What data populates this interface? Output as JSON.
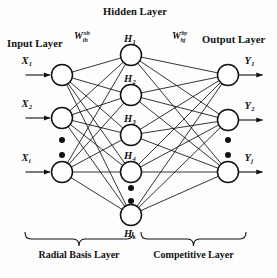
{
  "figure": {
    "type": "neural-network-architecture-diagram",
    "background_color": "#fdfdfd",
    "stroke_color": "#111111"
  },
  "titles": {
    "input_layer": "Input Layer",
    "hidden_layer": "Hidden Layer",
    "output_layer": "Output Layer"
  },
  "weights": {
    "input_to_hidden": {
      "base": "W",
      "subscript": "ih",
      "superscript": "xh"
    },
    "hidden_to_output": {
      "base": "W",
      "subscript": "hj",
      "superscript": "hy"
    }
  },
  "layers": {
    "input": {
      "name": "input-layer",
      "nodes": [
        {
          "id": "x1",
          "base": "X",
          "sub": "1",
          "cx": 62,
          "cy": 75
        },
        {
          "id": "x2",
          "base": "X",
          "sub": "2",
          "cx": 62,
          "cy": 118
        },
        {
          "id": "xi",
          "base": "X",
          "sub": "i",
          "cx": 62,
          "cy": 172
        }
      ],
      "ellipsis_dots": [
        {
          "cx": 62,
          "cy": 140
        },
        {
          "cx": 62,
          "cy": 155
        }
      ]
    },
    "hidden": {
      "name": "hidden-layer",
      "nodes": [
        {
          "id": "h1",
          "base": "H",
          "sub": "1",
          "cx": 131,
          "cy": 55
        },
        {
          "id": "h2",
          "base": "H",
          "sub": "2",
          "cx": 131,
          "cy": 95
        },
        {
          "id": "h3",
          "base": "H",
          "sub": "3",
          "cx": 131,
          "cy": 135
        },
        {
          "id": "h4",
          "base": "H",
          "sub": "4",
          "cx": 131,
          "cy": 172
        },
        {
          "id": "hk",
          "base": "H",
          "sub": "k",
          "cx": 131,
          "cy": 215
        }
      ],
      "ellipsis_dots": [
        {
          "cx": 131,
          "cy": 188
        },
        {
          "cx": 131,
          "cy": 201
        }
      ]
    },
    "output": {
      "name": "output-layer",
      "nodes": [
        {
          "id": "y1",
          "base": "Y",
          "sub": "1",
          "cx": 228,
          "cy": 75
        },
        {
          "id": "y2",
          "base": "Y",
          "sub": "2",
          "cx": 228,
          "cy": 120
        },
        {
          "id": "yj",
          "base": "Y",
          "sub": "j",
          "cx": 228,
          "cy": 172
        }
      ],
      "ellipsis_dots": [
        {
          "cx": 228,
          "cy": 140
        },
        {
          "cx": 228,
          "cy": 155
        }
      ]
    }
  },
  "brackets": [
    {
      "id": "radial-basis",
      "label": "Radial Basis Layer",
      "x_start": 25,
      "x_end": 133,
      "y": 232
    },
    {
      "id": "competitive",
      "label": "Competitive Layer",
      "x_start": 141,
      "x_end": 246,
      "y": 232
    }
  ],
  "node_radius": 10.5,
  "arrow_in_length": 26,
  "arrow_out_length": 26
}
